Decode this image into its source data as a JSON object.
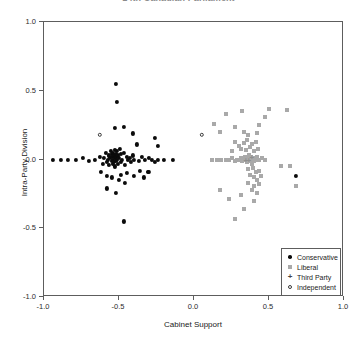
{
  "chart_data": {
    "type": "scatter",
    "title": "14th Canadian Parliament",
    "xlabel": "Cabinet Support",
    "ylabel": "Intra-Party Division",
    "xlim": [
      -1.0,
      1.0
    ],
    "ylim": [
      -1.0,
      1.0
    ],
    "xticks": [
      -1.0,
      -0.5,
      0.0,
      0.5,
      1.0
    ],
    "yticks": [
      -1.0,
      -0.5,
      0.0,
      0.5,
      1.0
    ],
    "xticklabels": [
      "-1.0",
      "-0.5",
      "0.0",
      "0.5",
      "1.0"
    ],
    "yticklabels": [
      "-1.0",
      "-0.5",
      "0.0",
      "0.5",
      "1.0"
    ],
    "grid": false,
    "legend_position": "bottom-right",
    "series": [
      {
        "name": "Conservative",
        "marker": "filled-circle",
        "color": "#0b0b0b",
        "points": [
          [
            -0.94,
            0.0
          ],
          [
            -0.89,
            0.0
          ],
          [
            -0.84,
            0.0
          ],
          [
            -0.79,
            0.0
          ],
          [
            -0.74,
            0.01
          ],
          [
            -0.7,
            -0.01
          ],
          [
            -0.66,
            0.0
          ],
          [
            -0.63,
            0.02
          ],
          [
            -0.61,
            -0.03
          ],
          [
            -0.6,
            0.01
          ],
          [
            -0.59,
            0.05
          ],
          [
            -0.58,
            -0.02
          ],
          [
            -0.575,
            0.0
          ],
          [
            -0.57,
            0.03
          ],
          [
            -0.565,
            -0.04
          ],
          [
            -0.56,
            0.01
          ],
          [
            -0.555,
            0.06
          ],
          [
            -0.55,
            -0.01
          ],
          [
            -0.548,
            0.02
          ],
          [
            -0.545,
            0.04
          ],
          [
            -0.542,
            -0.03
          ],
          [
            -0.54,
            0.0
          ],
          [
            -0.538,
            0.05
          ],
          [
            -0.535,
            0.03
          ],
          [
            -0.532,
            -0.02
          ],
          [
            -0.53,
            0.01
          ],
          [
            -0.528,
            0.07
          ],
          [
            -0.525,
            -0.05
          ],
          [
            -0.522,
            0.02
          ],
          [
            -0.52,
            0.04
          ],
          [
            -0.518,
            -0.01
          ],
          [
            -0.515,
            0.0
          ],
          [
            -0.512,
            0.06
          ],
          [
            -0.51,
            -0.03
          ],
          [
            -0.505,
            0.03
          ],
          [
            -0.5,
            0.01
          ],
          [
            -0.495,
            0.08
          ],
          [
            -0.49,
            -0.02
          ],
          [
            -0.485,
            0.04
          ],
          [
            -0.48,
            0.0
          ],
          [
            -0.47,
            0.05
          ],
          [
            -0.46,
            -0.04
          ],
          [
            -0.45,
            0.02
          ],
          [
            -0.44,
            0.0
          ],
          [
            -0.43,
            0.01
          ],
          [
            -0.42,
            -0.02
          ],
          [
            -0.41,
            0.03
          ],
          [
            -0.4,
            0.0
          ],
          [
            -0.38,
            0.11
          ],
          [
            -0.37,
            -0.01
          ],
          [
            -0.35,
            0.02
          ],
          [
            -0.33,
            0.0
          ],
          [
            -0.31,
            -0.09
          ],
          [
            -0.3,
            0.01
          ],
          [
            -0.28,
            0.0
          ],
          [
            -0.26,
            -0.02
          ],
          [
            -0.24,
            0.0
          ],
          [
            -0.2,
            0.0
          ],
          [
            -0.14,
            0.0
          ],
          [
            -0.52,
            0.55
          ],
          [
            -0.515,
            0.42
          ],
          [
            -0.53,
            0.23
          ],
          [
            -0.47,
            0.24
          ],
          [
            -0.41,
            0.19
          ],
          [
            -0.62,
            -0.09
          ],
          [
            -0.58,
            -0.12
          ],
          [
            -0.55,
            -0.13
          ],
          [
            -0.5,
            -0.15
          ],
          [
            -0.485,
            -0.11
          ],
          [
            -0.46,
            -0.17
          ],
          [
            -0.445,
            -0.1
          ],
          [
            -0.4,
            -0.12
          ],
          [
            -0.36,
            -0.08
          ],
          [
            -0.335,
            -0.13
          ],
          [
            -0.3,
            -0.09
          ],
          [
            -0.58,
            -0.21
          ],
          [
            -0.52,
            -0.24
          ],
          [
            -0.47,
            -0.45
          ],
          [
            -0.26,
            0.16
          ],
          [
            -0.24,
            0.1
          ],
          [
            0.68,
            -0.12
          ]
        ]
      },
      {
        "name": "Liberal",
        "marker": "filled-square",
        "color": "#a9a9a9",
        "points": [
          [
            0.12,
            0.0
          ],
          [
            0.15,
            0.0
          ],
          [
            0.18,
            0.0
          ],
          [
            0.21,
            0.0
          ],
          [
            0.23,
            0.0
          ],
          [
            0.25,
            0.01
          ],
          [
            0.27,
            -0.01
          ],
          [
            0.285,
            0.0
          ],
          [
            0.3,
            0.0
          ],
          [
            0.31,
            0.01
          ],
          [
            0.32,
            -0.01
          ],
          [
            0.33,
            0.0
          ],
          [
            0.34,
            0.02
          ],
          [
            0.345,
            0.0
          ],
          [
            0.35,
            -0.02
          ],
          [
            0.355,
            0.01
          ],
          [
            0.36,
            0.0
          ],
          [
            0.365,
            0.03
          ],
          [
            0.37,
            -0.01
          ],
          [
            0.375,
            0.0
          ],
          [
            0.38,
            0.02
          ],
          [
            0.385,
            -0.03
          ],
          [
            0.39,
            0.0
          ],
          [
            0.395,
            0.01
          ],
          [
            0.4,
            -0.01
          ],
          [
            0.41,
            0.0
          ],
          [
            0.42,
            0.02
          ],
          [
            0.43,
            0.0
          ],
          [
            0.45,
            0.01
          ],
          [
            0.47,
            0.0
          ],
          [
            0.3,
            0.1
          ],
          [
            0.315,
            0.08
          ],
          [
            0.33,
            0.12
          ],
          [
            0.345,
            0.07
          ],
          [
            0.355,
            0.14
          ],
          [
            0.37,
            0.09
          ],
          [
            0.385,
            0.11
          ],
          [
            0.4,
            0.06
          ],
          [
            0.41,
            0.13
          ],
          [
            0.425,
            0.08
          ],
          [
            0.25,
            0.06
          ],
          [
            0.27,
            0.13
          ],
          [
            0.33,
            0.2
          ],
          [
            0.36,
            0.18
          ],
          [
            0.42,
            0.19
          ],
          [
            0.27,
            0.24
          ],
          [
            0.43,
            0.25
          ],
          [
            0.21,
            0.33
          ],
          [
            0.32,
            0.35
          ],
          [
            0.47,
            0.31
          ],
          [
            0.5,
            0.37
          ],
          [
            0.13,
            0.26
          ],
          [
            0.17,
            0.2
          ],
          [
            0.62,
            0.36
          ],
          [
            0.36,
            -0.07
          ],
          [
            0.375,
            -0.11
          ],
          [
            0.39,
            -0.06
          ],
          [
            0.4,
            -0.13
          ],
          [
            0.41,
            -0.09
          ],
          [
            0.42,
            -0.15
          ],
          [
            0.435,
            -0.08
          ],
          [
            0.445,
            -0.12
          ],
          [
            0.36,
            -0.17
          ],
          [
            0.4,
            -0.19
          ],
          [
            0.43,
            -0.18
          ],
          [
            0.385,
            -0.22
          ],
          [
            0.42,
            -0.24
          ],
          [
            0.4,
            -0.3
          ],
          [
            0.58,
            -0.05
          ],
          [
            0.64,
            -0.05
          ],
          [
            0.68,
            -0.19
          ],
          [
            0.23,
            -0.29
          ],
          [
            0.17,
            -0.22
          ],
          [
            0.33,
            -0.36
          ],
          [
            0.27,
            -0.43
          ],
          [
            0.31,
            -0.26
          ]
        ]
      },
      {
        "name": "Third Party",
        "marker": "plus",
        "color": "#8e8e8e",
        "points": [
          [
            0.345,
            0.0
          ],
          [
            0.365,
            0.0
          ],
          [
            0.385,
            0.02
          ]
        ]
      },
      {
        "name": "Independent",
        "marker": "open-circle",
        "color": "#3a3a3a",
        "points": [
          [
            -0.63,
            0.18
          ],
          [
            0.05,
            0.18
          ]
        ]
      }
    ],
    "legend_entries": [
      {
        "label": "Conservative",
        "marker": "filled-circle"
      },
      {
        "label": "Liberal",
        "marker": "filled-square"
      },
      {
        "label": "Third Party",
        "marker": "plus"
      },
      {
        "label": "Independent",
        "marker": "open-circle"
      }
    ]
  }
}
